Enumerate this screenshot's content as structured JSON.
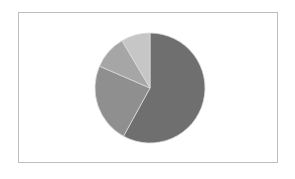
{
  "chart_data": {
    "type": "pie",
    "title": "",
    "legend": "none",
    "slices": [
      {
        "label": "",
        "value": 58,
        "color": "#6f6f6f"
      },
      {
        "label": "",
        "value": 23.5,
        "color": "#8f8f8f"
      },
      {
        "label": "",
        "value": 10,
        "color": "#a6a6a6"
      },
      {
        "label": "",
        "value": 8.5,
        "color": "#c6c6c6"
      }
    ],
    "start_angle_deg": 0,
    "direction": "clockwise"
  },
  "colors": {
    "frame_border": "#bdbdbd",
    "background": "#ffffff",
    "slice_separator": "#d9d9d9"
  }
}
